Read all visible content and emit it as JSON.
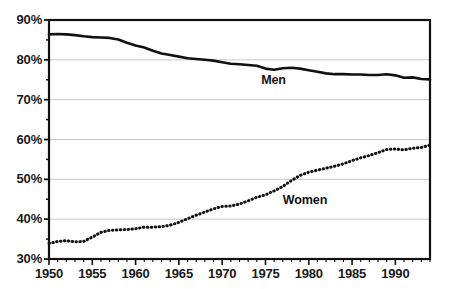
{
  "chart_data": {
    "type": "line",
    "title": "",
    "xlabel": "",
    "ylabel": "",
    "xlim": [
      1950,
      1994
    ],
    "ylim": [
      30,
      90
    ],
    "ytick_labels": [
      "90%",
      "80%",
      "70%",
      "60%",
      "50%",
      "40%",
      "30%"
    ],
    "ytick_values": [
      90,
      80,
      70,
      60,
      50,
      40,
      30
    ],
    "yminor_values": [
      85,
      75,
      65,
      55,
      45,
      35
    ],
    "xtick_labels": [
      "1950",
      "1955",
      "1960",
      "1965",
      "1970",
      "1975",
      "1980",
      "1985",
      "1990"
    ],
    "xtick_values": [
      1950,
      1955,
      1960,
      1965,
      1970,
      1975,
      1980,
      1985,
      1990
    ],
    "grid": true,
    "grid_color": "#c9c9c9",
    "axis_color": "#111111",
    "legend_position": "inline-annotation",
    "x": [
      1950,
      1951,
      1952,
      1953,
      1954,
      1955,
      1956,
      1957,
      1958,
      1959,
      1960,
      1961,
      1962,
      1963,
      1964,
      1965,
      1966,
      1967,
      1968,
      1969,
      1970,
      1971,
      1972,
      1973,
      1974,
      1975,
      1976,
      1977,
      1978,
      1979,
      1980,
      1981,
      1982,
      1983,
      1984,
      1985,
      1986,
      1987,
      1988,
      1989,
      1990,
      1991,
      1992,
      1993,
      1994
    ],
    "series": [
      {
        "name": "Men",
        "label": "Men",
        "style": "solid",
        "color": "#111111",
        "values": [
          86.4,
          86.5,
          86.4,
          86.2,
          85.9,
          85.7,
          85.6,
          85.5,
          85.1,
          84.3,
          83.6,
          83.1,
          82.3,
          81.6,
          81.2,
          80.8,
          80.4,
          80.2,
          80.0,
          79.8,
          79.4,
          79.0,
          78.9,
          78.7,
          78.5,
          77.8,
          77.5,
          77.9,
          78.0,
          77.8,
          77.4,
          77.0,
          76.6,
          76.4,
          76.4,
          76.3,
          76.3,
          76.2,
          76.2,
          76.4,
          76.1,
          75.5,
          75.6,
          75.2,
          75.1
        ]
      },
      {
        "name": "Women",
        "label": "Women",
        "style": "dotted",
        "color": "#111111",
        "values": [
          33.9,
          34.4,
          34.6,
          34.3,
          34.4,
          35.5,
          36.7,
          37.2,
          37.3,
          37.4,
          37.6,
          38.0,
          38.0,
          38.1,
          38.5,
          39.2,
          40.1,
          41.0,
          41.8,
          42.6,
          43.2,
          43.3,
          43.8,
          44.6,
          45.5,
          46.1,
          47.1,
          48.2,
          49.7,
          51.0,
          51.8,
          52.3,
          52.8,
          53.3,
          53.9,
          54.7,
          55.4,
          56.0,
          56.7,
          57.5,
          57.6,
          57.4,
          57.8,
          58.0,
          58.6
        ]
      }
    ],
    "annotations": [
      {
        "text": "Men",
        "x_value": 1974.5,
        "y_value": 74.6
      },
      {
        "text": "Women",
        "x_value": 1977.0,
        "y_value": 44.6
      }
    ]
  }
}
